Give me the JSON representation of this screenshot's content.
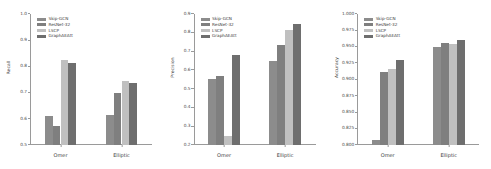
{
  "figure": {
    "background": "#ffffff",
    "panel_count": 3
  },
  "series_colors": [
    "#8c8c8c",
    "#7f7f7f",
    "#c0c0c0",
    "#6e6e6e"
  ],
  "legend": {
    "entries": [
      {
        "label": "Skip-GCN",
        "color": "#8c8c8c"
      },
      {
        "label": "ResNet-32",
        "color": "#7f7f7f"
      },
      {
        "label": "LSCP",
        "color": "#c0c0c0"
      },
      {
        "label": "GraphAEAtt",
        "color": "#6e6e6e"
      }
    ]
  },
  "chart_data": [
    {
      "type": "bar",
      "title": "",
      "xlabel": "",
      "ylabel": "Recall",
      "categories": [
        "Omer",
        "Elliptic"
      ],
      "ylim": [
        0.5,
        1.0
      ],
      "yticks": [
        "0.5",
        "0.6",
        "0.7",
        "0.8",
        "0.9",
        "1.0"
      ],
      "ytick_values": [
        0.5,
        0.6,
        0.7,
        0.8,
        0.9,
        1.0
      ],
      "grid": false,
      "legend_position": "upper left",
      "series": [
        {
          "name": "Skip-GCN",
          "values": [
            0.612,
            0.613
          ]
        },
        {
          "name": "ResNet-32",
          "values": [
            0.573,
            0.697
          ]
        },
        {
          "name": "LSCP",
          "values": [
            0.823,
            0.743
          ]
        },
        {
          "name": "GraphAEAtt",
          "values": [
            0.814,
            0.737
          ]
        }
      ]
    },
    {
      "type": "bar",
      "title": "",
      "xlabel": "",
      "ylabel": "Precision",
      "categories": [
        "Omer",
        "Elliptic"
      ],
      "ylim": [
        0.2,
        0.9
      ],
      "yticks": [
        "0.2",
        "0.3",
        "0.4",
        "0.5",
        "0.6",
        "0.7",
        "0.8",
        "0.9"
      ],
      "ytick_values": [
        0.2,
        0.3,
        0.4,
        0.5,
        0.6,
        0.7,
        0.8,
        0.9
      ],
      "grid": false,
      "legend_position": "upper left",
      "series": [
        {
          "name": "Skip-GCN",
          "values": [
            0.551,
            0.651
          ]
        },
        {
          "name": "ResNet-32",
          "values": [
            0.567,
            0.735
          ]
        },
        {
          "name": "LSCP",
          "values": [
            0.247,
            0.812
          ]
        },
        {
          "name": "GraphAEAtt",
          "values": [
            0.679,
            0.846
          ]
        }
      ]
    },
    {
      "type": "bar",
      "title": "",
      "xlabel": "",
      "ylabel": "Accuracy",
      "categories": [
        "Omer",
        "Elliptic"
      ],
      "ylim": [
        0.8,
        1.0
      ],
      "yticks": [
        "0.800",
        "0.825",
        "0.850",
        "0.875",
        "0.900",
        "0.925",
        "0.950",
        "0.975",
        "1.000"
      ],
      "ytick_values": [
        0.8,
        0.825,
        0.85,
        0.875,
        0.9,
        0.925,
        0.95,
        0.975,
        1.0
      ],
      "grid": false,
      "legend_position": "upper left",
      "series": [
        {
          "name": "Skip-GCN",
          "values": [
            0.807,
            0.95
          ]
        },
        {
          "name": "ResNet-32",
          "values": [
            0.911,
            0.956
          ]
        },
        {
          "name": "LSCP",
          "values": [
            0.916,
            0.954
          ]
        },
        {
          "name": "GraphAEAtt",
          "values": [
            0.93,
            0.961
          ]
        }
      ]
    }
  ]
}
